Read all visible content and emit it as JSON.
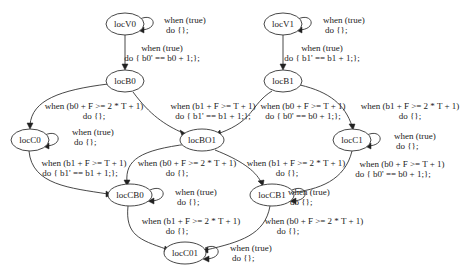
{
  "diagram": {
    "type": "state-machine",
    "nodes": [
      {
        "id": "locV0",
        "label": "locV0",
        "x": 125,
        "y": 24
      },
      {
        "id": "locV1",
        "label": "locV1",
        "x": 283,
        "y": 24
      },
      {
        "id": "locB0",
        "label": "locB0",
        "x": 125,
        "y": 81
      },
      {
        "id": "locB1",
        "label": "locB1",
        "x": 283,
        "y": 81
      },
      {
        "id": "locC0",
        "label": "locC0",
        "x": 30,
        "y": 140
      },
      {
        "id": "locBO1",
        "label": "locBO1",
        "x": 202,
        "y": 140
      },
      {
        "id": "locC1",
        "label": "locC1",
        "x": 352,
        "y": 140
      },
      {
        "id": "locCB0",
        "label": "locCB0",
        "x": 130,
        "y": 195
      },
      {
        "id": "locCB1",
        "label": "locCB1",
        "x": 272,
        "y": 195
      },
      {
        "id": "locC01",
        "label": "locC01",
        "x": 185,
        "y": 253
      }
    ],
    "edges": [
      {
        "from": "locV0",
        "to": "locV0",
        "line1": "when (true)",
        "line2": "do {};"
      },
      {
        "from": "locV0",
        "to": "locB0",
        "line1": "when (true)",
        "line2": "do { b0' == b0 + 1;};"
      },
      {
        "from": "locV1",
        "to": "locV1",
        "line1": "when (true)",
        "line2": "do {};"
      },
      {
        "from": "locV1",
        "to": "locB1",
        "line1": "when (true)",
        "line2": "do { b1' == b1 + 1;};"
      },
      {
        "from": "locB0",
        "to": "locC0",
        "line1": "when (b0 + F >= 2 * T + 1)",
        "line2": "do {};"
      },
      {
        "from": "locB0",
        "to": "locBO1",
        "line1": "when (b1 + F >= T + 1)",
        "line2": "do { b1' == b1 + 1;};"
      },
      {
        "from": "locB1",
        "to": "locBO1",
        "line1": "when (b0 + F >= T + 1)",
        "line2": "do { b0' == b0 + 1;};"
      },
      {
        "from": "locB1",
        "to": "locC1",
        "line1": "when (b1 + F >= 2 * T + 1)",
        "line2": "do {};"
      },
      {
        "from": "locC0",
        "to": "locC0",
        "line1": "when (true)",
        "line2": "do {};"
      },
      {
        "from": "locC0",
        "to": "locCB0",
        "line1": "when (b1 + F >= T + 1)",
        "line2": "do { b1' == b1 + 1;};"
      },
      {
        "from": "locBO1",
        "to": "locCB0",
        "line1": "when (b0 + F >= 2 * T + 1)",
        "line2": "do {};"
      },
      {
        "from": "locBO1",
        "to": "locCB1",
        "line1": "when (b1 + F >= 2 * T + 1)",
        "line2": "do {};"
      },
      {
        "from": "locC1",
        "to": "locC1",
        "line1": "when (true)",
        "line2": "do {};"
      },
      {
        "from": "locC1",
        "to": "locCB1",
        "line1": "when (b0 + F >= T + 1)",
        "line2": "do { b0' == b0 + 1;};"
      },
      {
        "from": "locCB0",
        "to": "locCB0",
        "line1": "when (true)",
        "line2": "do {};"
      },
      {
        "from": "locCB0",
        "to": "locC01",
        "line1": "when (b1 + F >= 2 * T + 1)",
        "line2": "do {};"
      },
      {
        "from": "locCB1",
        "to": "locCB1",
        "line1": "when (true)",
        "line2": "do {};"
      },
      {
        "from": "locCB1",
        "to": "locC01",
        "line1": "when (b0 + F >= 2 * T + 1)",
        "line2": "do {};"
      },
      {
        "from": "locC01",
        "to": "locC01",
        "line1": "when (true)",
        "line2": "do {};"
      }
    ]
  }
}
